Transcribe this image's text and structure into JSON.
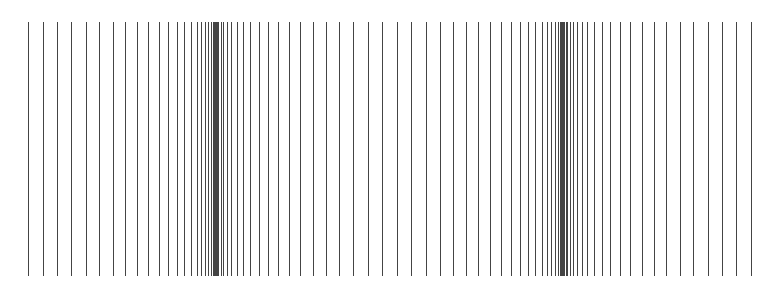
{
  "figure": {
    "line_color": "#444444",
    "background": "#ffffff",
    "line_top": 22,
    "line_bottom": 276,
    "x_start": 28,
    "x_end": 751,
    "cluster_centers": [
      215,
      563
    ],
    "sparse_center": 389,
    "period": 348,
    "line_count": 98
  }
}
